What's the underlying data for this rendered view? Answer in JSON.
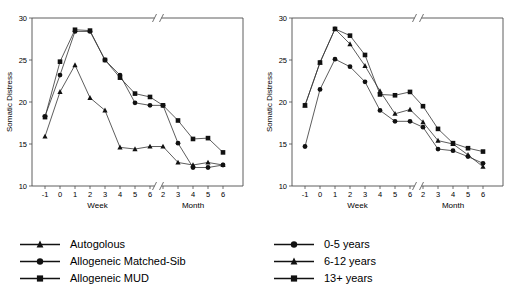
{
  "chart_data": [
    {
      "id": "left",
      "type": "line",
      "title": "",
      "xlabel_week": "Week",
      "xlabel_month": "Month",
      "ylabel": "Somatic Distress",
      "ylim": [
        10,
        30
      ],
      "yticks": [
        10,
        15,
        20,
        25,
        30
      ],
      "grid": false,
      "axis_break": true,
      "legend_position": "below",
      "x_week": [
        "-1",
        "0",
        "1",
        "2",
        "3",
        "4",
        "5",
        "6"
      ],
      "x_month": [
        "2",
        "3",
        "4",
        "5",
        "6"
      ],
      "series": [
        {
          "name": "Autogolous",
          "marker": "triangle",
          "values": [
            15.9,
            21.2,
            24.4,
            20.5,
            19.0,
            14.6,
            14.4,
            14.7,
            14.7,
            12.8,
            12.5,
            12.8,
            12.5
          ]
        },
        {
          "name": "Allogeneic Matched-Sib",
          "marker": "circle",
          "values": [
            18.3,
            23.2,
            28.4,
            28.4,
            25.0,
            23.2,
            19.9,
            19.6,
            19.6,
            15.1,
            12.2,
            12.2,
            12.5
          ]
        },
        {
          "name": "Allogeneic MUD",
          "marker": "square",
          "values": [
            18.2,
            24.8,
            28.6,
            28.5,
            25.0,
            22.9,
            21.0,
            20.6,
            19.6,
            17.8,
            15.6,
            15.7,
            14.0
          ]
        }
      ]
    },
    {
      "id": "right",
      "type": "line",
      "title": "",
      "xlabel_week": "Week",
      "xlabel_month": "Month",
      "ylabel": "Somatic Distress",
      "ylim": [
        10,
        30
      ],
      "yticks": [
        10,
        15,
        20,
        25,
        30
      ],
      "grid": false,
      "axis_break": true,
      "legend_position": "below",
      "x_week": [
        "-1",
        "0",
        "1",
        "2",
        "3",
        "4",
        "5",
        "6"
      ],
      "x_month": [
        "2",
        "3",
        "4",
        "5",
        "6"
      ],
      "series": [
        {
          "name": "0-5 years",
          "marker": "circle",
          "values": [
            14.7,
            21.5,
            25.1,
            24.2,
            22.4,
            19.0,
            17.7,
            17.7,
            17.0,
            14.4,
            14.2,
            13.5,
            12.7
          ]
        },
        {
          "name": "6-12 years",
          "marker": "triangle",
          "values": [
            19.6,
            24.7,
            28.7,
            26.9,
            24.3,
            21.3,
            18.6,
            19.1,
            17.6,
            15.4,
            15.0,
            13.7,
            12.3
          ]
        },
        {
          "name": "13+ years",
          "marker": "square",
          "values": [
            19.6,
            24.7,
            28.7,
            27.9,
            25.6,
            20.9,
            20.8,
            21.2,
            19.5,
            16.8,
            15.1,
            14.5,
            14.1
          ]
        }
      ]
    }
  ],
  "legend_left": {
    "items": [
      {
        "label": "Autogolous",
        "marker": "triangle"
      },
      {
        "label": "Allogeneic Matched-Sib",
        "marker": "circle"
      },
      {
        "label": "Allogeneic MUD",
        "marker": "square"
      }
    ]
  },
  "legend_right": {
    "items": [
      {
        "label": "0-5 years",
        "marker": "circle"
      },
      {
        "label": "6-12 years",
        "marker": "triangle"
      },
      {
        "label": "13+ years",
        "marker": "square"
      }
    ]
  }
}
